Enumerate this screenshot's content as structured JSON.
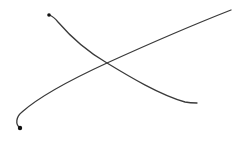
{
  "canvas": {
    "width": 248,
    "height": 142,
    "background": "#ffffff"
  },
  "strokes": [
    {
      "name": "stroke-descending",
      "color": "#3a3a3a",
      "width": 1.3,
      "path": "M49,15 C52,16 55,18 58,22 C70,36 88,52 107,63 C130,77 160,95 185,102 C190,103 194,103 197,103",
      "start_blob": {
        "cx": 49,
        "cy": 15,
        "r": 1.8,
        "color": "#111111"
      }
    },
    {
      "name": "stroke-ascending",
      "color": "#3a3a3a",
      "width": 1.3,
      "path": "M20,128 C15,124 16,117 22,112 C40,96 70,80 107,63 C140,48 180,30 231,10",
      "start_blob": {
        "cx": 20,
        "cy": 128,
        "r": 2.2,
        "color": "#111111"
      }
    }
  ]
}
